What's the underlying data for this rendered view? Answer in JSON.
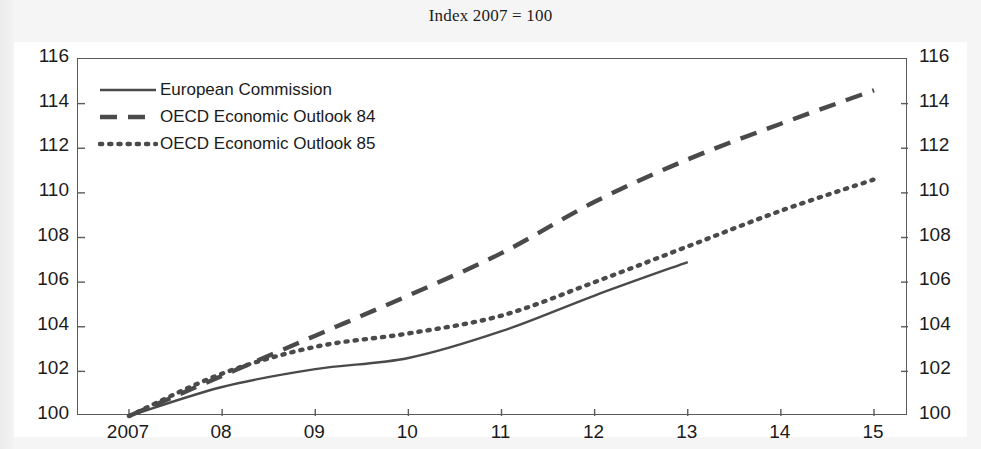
{
  "chart_data": {
    "type": "line",
    "title": "Index 2007 = 100",
    "xlabel": "",
    "ylabel": "",
    "xlim": [
      2007,
      2015
    ],
    "ylim": [
      100,
      116
    ],
    "grid": false,
    "legend_position": "top-left",
    "x_ticks": [
      "2007",
      "08",
      "09",
      "10",
      "11",
      "12",
      "13",
      "14",
      "15"
    ],
    "x_tick_values": [
      2007,
      2008,
      2009,
      2010,
      2011,
      2012,
      2013,
      2014,
      2015
    ],
    "y_ticks": [
      "100",
      "102",
      "104",
      "106",
      "108",
      "110",
      "112",
      "114",
      "116"
    ],
    "y_tick_values": [
      100,
      102,
      104,
      106,
      108,
      110,
      112,
      114,
      116
    ],
    "y_axis_right_ticks": [
      "100",
      "102",
      "104",
      "106",
      "108",
      "110",
      "112",
      "114",
      "116"
    ],
    "series": [
      {
        "name": "European Commission",
        "style": "solid",
        "color": "#4a4a4a",
        "x": [
          2007,
          2008,
          2009,
          2010,
          2011,
          2012,
          2013
        ],
        "values": [
          100.0,
          101.3,
          102.1,
          102.6,
          103.8,
          105.4,
          106.9
        ]
      },
      {
        "name": "OECD Economic Outlook 84",
        "style": "dashed",
        "color": "#4a4a4a",
        "x": [
          2007,
          2008,
          2009,
          2010,
          2011,
          2012,
          2013,
          2014,
          2015
        ],
        "values": [
          100.0,
          101.8,
          103.6,
          105.4,
          107.3,
          109.6,
          111.5,
          113.1,
          114.6
        ]
      },
      {
        "name": "OECD Economic Outlook 85",
        "style": "dotted",
        "color": "#4a4a4a",
        "x": [
          2007,
          2008,
          2009,
          2010,
          2011,
          2012,
          2013,
          2014,
          2015
        ],
        "values": [
          100.0,
          101.9,
          103.1,
          103.7,
          104.5,
          106.0,
          107.6,
          109.2,
          110.6
        ]
      }
    ]
  },
  "legend": {
    "items": [
      {
        "label": "European Commission",
        "style": "solid"
      },
      {
        "label": "OECD Economic Outlook 84",
        "style": "dashed"
      },
      {
        "label": "OECD Economic Outlook 85",
        "style": "dotted"
      }
    ]
  },
  "colors": {
    "line": "#4a4a4a",
    "axis": "#5a5a5a",
    "text": "#1b1b1b",
    "page_background": "#f4f3f3",
    "plot_background": "#ffffff"
  }
}
